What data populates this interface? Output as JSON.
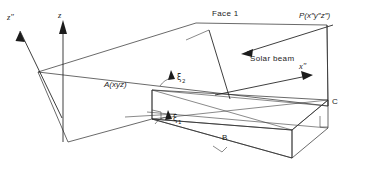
{
  "figure": {
    "background_color": "#ffffff",
    "line_color": "#2a2a2a",
    "width": 382,
    "height": 170
  },
  "axes": [
    {
      "id": "z-double-prime",
      "label": "z″",
      "name": "z-double-prime-axis",
      "direction": "up-left"
    },
    {
      "id": "z",
      "label": "z",
      "name": "z-axis",
      "direction": "up"
    },
    {
      "id": "x-double-prime",
      "label": "x″",
      "name": "x-double-prime-axis",
      "direction": "right"
    }
  ],
  "labels": {
    "z_double_prime": "z″",
    "z": "z",
    "x_double_prime": "x″",
    "face": "Face 1",
    "solar_beam": "Solar beam",
    "point_a": "A(xyz)",
    "point_p": "P(x″y″z″)",
    "point_b": "B",
    "point_c": "C",
    "xi_1_symbol": "ξ",
    "xi_1_subscript": "1",
    "xi_2_symbol": "ξ",
    "xi_2_subscript": "2"
  },
  "annotations": [
    {
      "name": "face-1-leader",
      "text": "Face 1",
      "description": "leader line to inclined plane"
    },
    {
      "name": "solar-beam-arrow",
      "text": "Solar beam",
      "description": "arrow pointing up-left along beam"
    },
    {
      "name": "angle-xi-1",
      "text": "ξ1",
      "description": "incidence angle at lower edge"
    },
    {
      "name": "angle-xi-2",
      "text": "ξ2",
      "description": "incidence angle at upper edge"
    },
    {
      "name": "right-angle-marker-b",
      "description": "right angle square near B"
    },
    {
      "name": "right-angle-marker-c",
      "description": "right angle square near C"
    }
  ]
}
